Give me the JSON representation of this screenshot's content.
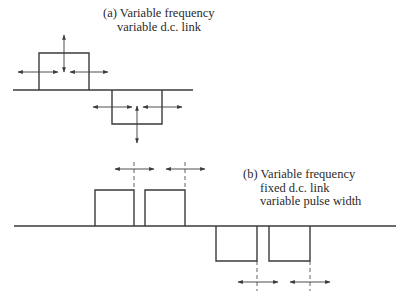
{
  "figure": {
    "panel_a": {
      "caption_lines": [
        "(a) Variable frequency",
        "variable d.c. link"
      ],
      "baseline": {
        "x1": 13,
        "x2": 193,
        "y": 90
      },
      "pulses": [
        {
          "polarity": "positive",
          "left": 39,
          "right": 89,
          "level": 53
        },
        {
          "polarity": "negative",
          "left": 112,
          "right": 162,
          "level": 124
        }
      ],
      "arrows": {
        "horizontal": [
          {
            "x1": 18,
            "x2": 58,
            "y": 72,
            "heads": "both"
          },
          {
            "x1": 70,
            "x2": 108,
            "y": 72,
            "heads": "both"
          },
          {
            "x1": 93,
            "x2": 132,
            "y": 107,
            "heads": "both"
          },
          {
            "x1": 143,
            "x2": 182,
            "y": 107,
            "heads": "both"
          }
        ],
        "vertical": [
          {
            "x": 64,
            "y1": 35,
            "y2": 72,
            "heads": "both"
          },
          {
            "x": 137,
            "y1": 106,
            "y2": 143,
            "heads": "both"
          }
        ]
      }
    },
    "panel_b": {
      "caption_lines": [
        "(b) Variable frequency",
        "fixed d.c. link",
        "variable pulse width"
      ],
      "baseline": {
        "x1": 14,
        "x2": 396,
        "y": 226
      },
      "pulses": [
        {
          "polarity": "positive",
          "left": 95,
          "right": 134,
          "level": 190
        },
        {
          "polarity": "positive",
          "left": 145,
          "right": 185,
          "level": 190
        },
        {
          "polarity": "negative",
          "left": 216,
          "right": 257,
          "level": 261
        },
        {
          "polarity": "negative",
          "left": 269,
          "right": 310,
          "level": 261
        }
      ],
      "dashed_guides": [
        {
          "x": 134,
          "y1": 162,
          "y2": 190
        },
        {
          "x": 185,
          "y1": 162,
          "y2": 190
        },
        {
          "x": 257,
          "y1": 261,
          "y2": 291
        },
        {
          "x": 310,
          "y1": 261,
          "y2": 291
        }
      ],
      "arrows": {
        "horizontal": [
          {
            "x1": 115,
            "x2": 154,
            "y": 169,
            "heads": "both"
          },
          {
            "x1": 166,
            "x2": 205,
            "y": 169,
            "heads": "both"
          },
          {
            "x1": 238,
            "x2": 278,
            "y": 282,
            "heads": "both"
          },
          {
            "x1": 290,
            "x2": 330,
            "y": 282,
            "heads": "both"
          }
        ]
      }
    },
    "colors": {
      "stroke": "#3a3a3a",
      "text": "#2a2a2a",
      "background": "#ffffff"
    }
  }
}
